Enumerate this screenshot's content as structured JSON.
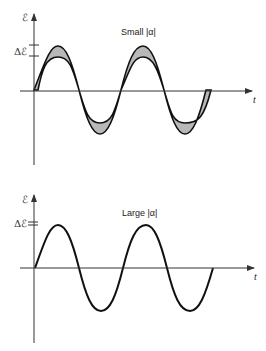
{
  "panels": [
    {
      "id": "small",
      "title": "Small |α|",
      "y_axis_label": "ℰ",
      "delta_label": "Δℰ",
      "x_axis_label": "t",
      "band": true,
      "band_fill": "#b8b8b8"
    },
    {
      "id": "large",
      "title": "Large |α|",
      "y_axis_label": "ℰ",
      "delta_label": "Δℰ",
      "x_axis_label": "t",
      "band": false
    }
  ],
  "colors": {
    "stroke": "#111111",
    "axis": "#333333",
    "band": "#b8b8b8"
  }
}
